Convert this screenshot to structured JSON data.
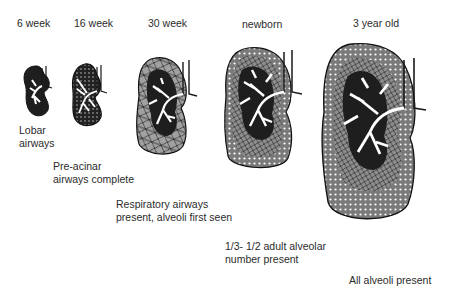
{
  "figure": {
    "stages": [
      {
        "id": "6wk",
        "label": "6 week",
        "caption": [
          "Lobar",
          "airways"
        ]
      },
      {
        "id": "16wk",
        "label": "16 week",
        "caption": [
          "Pre-acinar",
          "airways complete"
        ]
      },
      {
        "id": "30wk",
        "label": "30 week",
        "caption": [
          "Respiratory airways",
          "present, alveoli first seen"
        ]
      },
      {
        "id": "newborn",
        "label": "newborn",
        "caption": [
          "1/3- 1/2 adult alveolar",
          "number present"
        ]
      },
      {
        "id": "3yr",
        "label": "3 year old",
        "caption": [
          "All alveoli present"
        ]
      }
    ],
    "colors": {
      "airway_fill": "#1e1e1e",
      "bronchi": "#ffffff",
      "acinar_gray": "#9a9a9a",
      "alveoli_dots": "#ffffff",
      "outline": "#111111"
    }
  }
}
